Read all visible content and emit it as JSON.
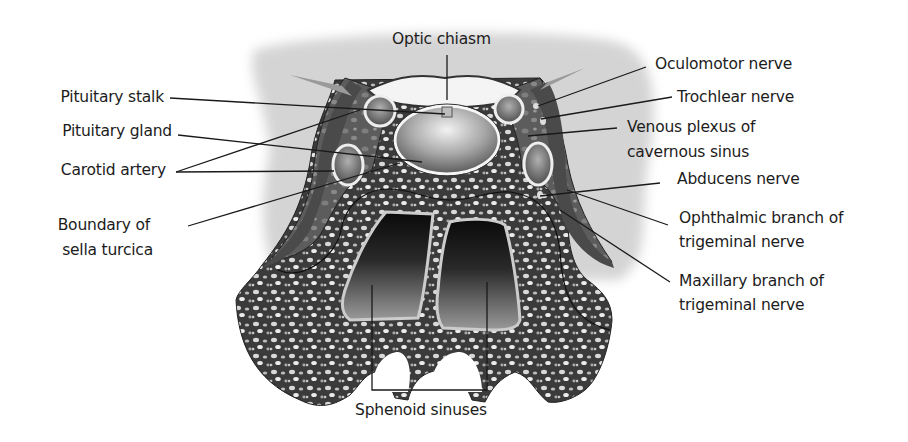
{
  "diagram": {
    "labels": {
      "optic_chiasm": "Optic chiasm",
      "pituitary_stalk": "Pituitary stalk",
      "pituitary_gland": "Pituitary gland",
      "carotid_artery": "Carotid artery",
      "boundary_line1": "Boundary of",
      "boundary_line2": "sella turcica",
      "oculomotor": "Oculomotor nerve",
      "trochlear": "Trochlear nerve",
      "venous_line1": "Venous plexus of",
      "venous_line2": "cavernous sinus",
      "abducens": "Abducens nerve",
      "ophthalmic_line1": "Ophthalmic branch of",
      "ophthalmic_line2": "trigeminal nerve",
      "maxillary_line1": "Maxillary branch of",
      "maxillary_line2": "trigeminal nerve",
      "sphenoid": "Sphenoid sinuses"
    },
    "colors": {
      "bone_dark": "#3a3a3a",
      "halo": "#d4d4d4",
      "leader_line": "#1a1a1a",
      "text": "#1c1c1c"
    }
  }
}
